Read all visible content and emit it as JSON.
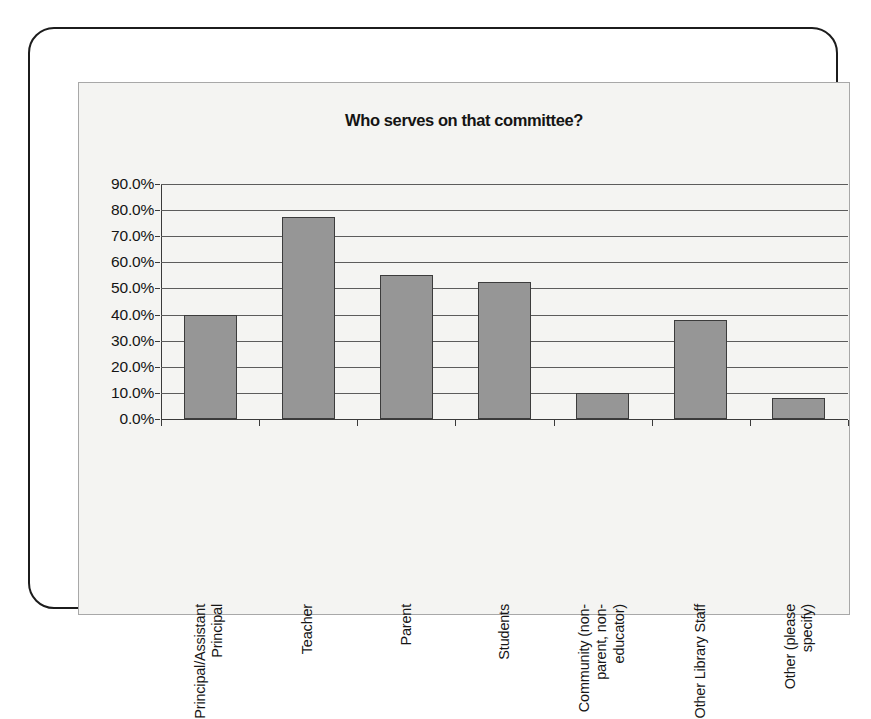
{
  "chart_data": {
    "type": "bar",
    "title": "Who serves on that committee?",
    "xlabel": "",
    "ylabel": "",
    "ylim": [
      0,
      90
    ],
    "ytick_labels": [
      "90.0%",
      "80.0%",
      "70.0%",
      "60.0%",
      "50.0%",
      "40.0%",
      "30.0%",
      "20.0%",
      "10.0%",
      "0.0%"
    ],
    "ytick_values": [
      90,
      80,
      70,
      60,
      50,
      40,
      30,
      20,
      10,
      0
    ],
    "grid": true,
    "legend": false,
    "bar_color": "#969696",
    "bar_border_color": "#3c3c3c",
    "plot_background": "#f4f4f2",
    "categories": [
      "Principal/Assistant Principal",
      "Teacher",
      "Parent",
      "Students",
      "Community (non-parent, non-educator)",
      "Other Library Staff",
      "Other (please specify)"
    ],
    "category_lines": [
      [
        "Principal/Assistant",
        "Principal"
      ],
      [
        "Teacher"
      ],
      [
        "Parent"
      ],
      [
        "Students"
      ],
      [
        "Community (non-",
        "parent, non-",
        "educator)"
      ],
      [
        "Other Library Staff"
      ],
      [
        "Other (please",
        "specify)"
      ]
    ],
    "values": [
      40.0,
      77.5,
      55.0,
      52.5,
      10.0,
      38.0,
      8.0
    ]
  }
}
